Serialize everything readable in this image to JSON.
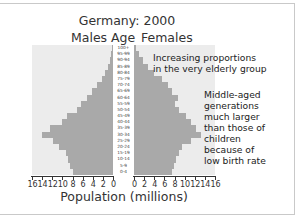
{
  "chart_data": {
    "type": "bar",
    "orientation": "horizontal-pyramid",
    "title": "Germany: 2000",
    "left_label": "Males",
    "center_label": "Age",
    "right_label": "Females",
    "xlabel": "Population (millions)",
    "categories": [
      "100+",
      "95-99",
      "90-94",
      "85-89",
      "80-84",
      "75-79",
      "70-74",
      "65-69",
      "60-64",
      "55-59",
      "50-54",
      "45-49",
      "40-44",
      "35-39",
      "30-34",
      "25-29",
      "20-24",
      "15-19",
      "10-14",
      "5-9",
      "0-4"
    ],
    "series": [
      {
        "name": "Males",
        "color": "#a9a9a9",
        "values": [
          0.2,
          0.3,
          0.6,
          0.9,
          1.6,
          2.2,
          3.1,
          4.1,
          5.1,
          6.3,
          7.1,
          9.0,
          10.0,
          12.4,
          14.1,
          11.8,
          10.6,
          9.2,
          8.8,
          8.4,
          8.0
        ]
      },
      {
        "name": "Females",
        "color": "#a9a9a9",
        "values": [
          0.3,
          1.0,
          1.8,
          2.8,
          4.0,
          5.5,
          6.7,
          7.5,
          8.7,
          8.1,
          8.9,
          10.3,
          11.3,
          12.3,
          13.3,
          11.3,
          9.5,
          8.9,
          8.3,
          7.9,
          7.5
        ]
      }
    ],
    "xlim": [
      0,
      16
    ],
    "left_ticks": [
      "16",
      "14",
      "12",
      "10",
      "8",
      "6",
      "4",
      "2",
      "0"
    ],
    "right_ticks": [
      "0",
      "2",
      "4",
      "6",
      "8",
      "10",
      "12",
      "14",
      "16"
    ],
    "annotations": [
      {
        "text": "Increasing proportions in the very elderly group"
      },
      {
        "text": "Middle-aged generations much larger than those of children because of low birth rate"
      }
    ],
    "grid": false
  },
  "labels": {
    "title": "Germany: 2000",
    "males": "Males",
    "age": "Age",
    "females": "Females",
    "xlabel": "Population (millions)",
    "anno1_line1": "Increasing proportions",
    "anno1_line2": "in the very elderly group",
    "anno2_lines": [
      "Middle-aged",
      "generations",
      "much larger",
      "than those of",
      "children",
      "because of",
      "low birth rate"
    ]
  }
}
